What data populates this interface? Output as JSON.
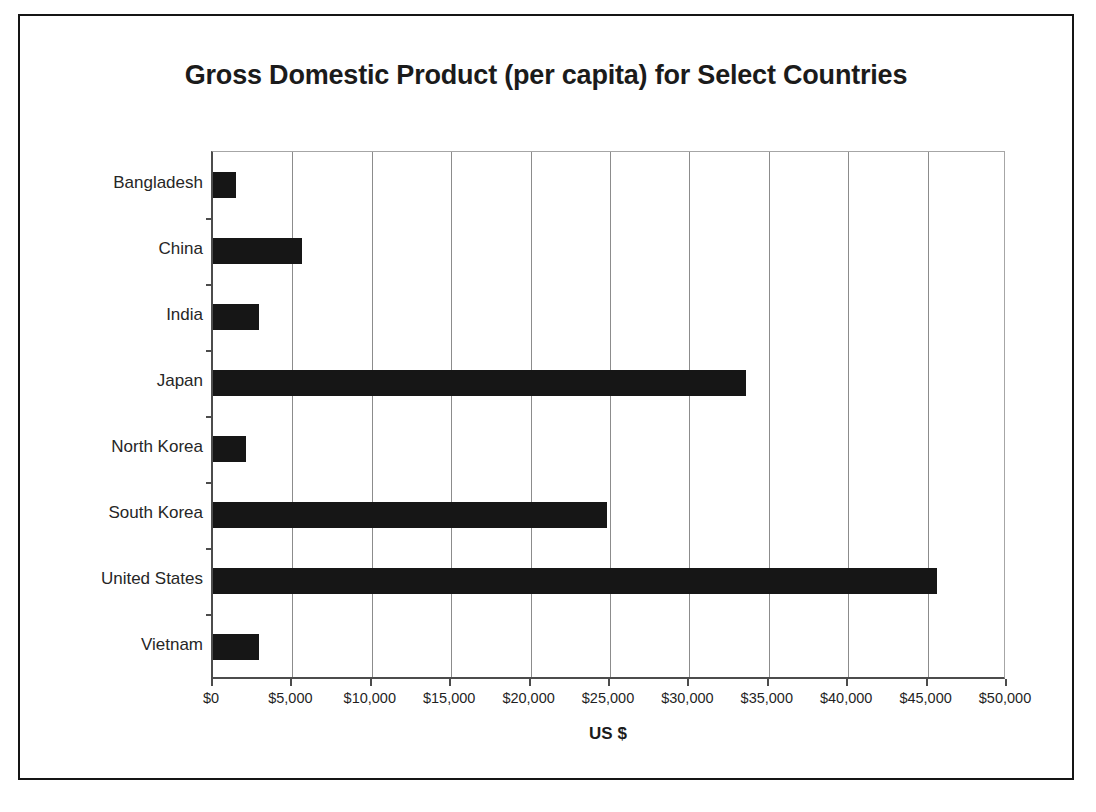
{
  "chart_data": {
    "type": "bar",
    "orientation": "horizontal",
    "title": "Gross Domestic Product (per capita) for Select Countries",
    "xlabel": "US $",
    "ylabel": "",
    "categories": [
      "Bangladesh",
      "China",
      "India",
      "Japan",
      "North Korea",
      "South Korea",
      "United States",
      "Vietnam"
    ],
    "values": [
      1440,
      5625,
      2875,
      33560,
      2060,
      24800,
      45600,
      2875
    ],
    "xlim": [
      0,
      50000
    ],
    "xtick_values": [
      0,
      5000,
      10000,
      15000,
      20000,
      25000,
      30000,
      35000,
      40000,
      45000,
      50000
    ],
    "xtick_labels": [
      "$0",
      "$5,000",
      "$10,000",
      "$15,000",
      "$20,000",
      "$25,000",
      "$30,000",
      "$35,000",
      "$40,000",
      "$45,000",
      "$50,000"
    ],
    "grid": "vertical",
    "legend": null,
    "bar_color": "#161616"
  },
  "frame": {
    "border_color": "#151515"
  }
}
